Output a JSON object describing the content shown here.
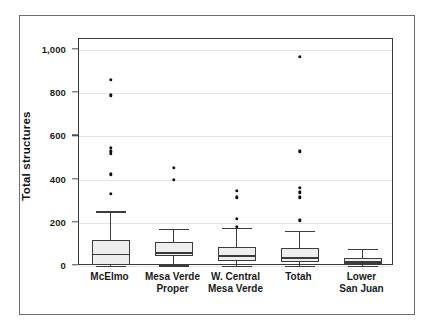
{
  "chart_data": {
    "type": "box",
    "title": "",
    "xlabel": "",
    "ylabel": "Total structures",
    "ylim": [
      0,
      1050
    ],
    "yticks": [
      0,
      200,
      400,
      600,
      800,
      1000
    ],
    "ytick_labels": [
      "0",
      "200",
      "400",
      "600",
      "800",
      "1,000"
    ],
    "grid": true,
    "legend": "none",
    "categories": [
      "McElmo",
      "Mesa Verde\nProper",
      "W. Central\nMesa Verde",
      "Totah",
      "Lower\nSan Juan"
    ],
    "boxes": [
      {
        "name": "McElmo",
        "whisker_low": 0,
        "q1": 5,
        "median": 57,
        "q3": 122,
        "whisker_high": 253,
        "outliers": [
          333,
          425,
          520,
          530,
          548,
          790,
          860
        ]
      },
      {
        "name": "Mesa Verde Proper",
        "whisker_low": 3,
        "q1": 48,
        "median": 63,
        "q3": 110,
        "whisker_high": 173,
        "outliers": [
          398,
          455
        ]
      },
      {
        "name": "W. Central Mesa Verde",
        "whisker_low": 0,
        "q1": 25,
        "median": 50,
        "q3": 90,
        "whisker_high": 178,
        "outliers": [
          182,
          218,
          318,
          348
        ]
      },
      {
        "name": "Totah",
        "whisker_low": 0,
        "q1": 18,
        "median": 40,
        "q3": 83,
        "whisker_high": 163,
        "outliers": [
          212,
          318,
          340,
          362,
          530,
          968
        ]
      },
      {
        "name": "Lower San Juan",
        "whisker_low": 0,
        "q1": 8,
        "median": 22,
        "q3": 38,
        "whisker_high": 80,
        "outliers": []
      }
    ],
    "colors": {
      "box_fill": "#eeeeee",
      "box_stroke": "#3c3c3c",
      "outlier": "#111111",
      "gridline": "#e3e3e3",
      "axis": "#3a3a3a",
      "frame": "#6e6e6e",
      "text": "#1a1a1a"
    }
  }
}
